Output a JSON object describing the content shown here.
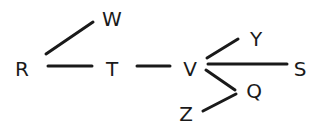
{
  "diagram": {
    "type": "tree",
    "nodes": [
      {
        "id": "R",
        "label": "R",
        "x": 22,
        "y": 76
      },
      {
        "id": "W",
        "label": "W",
        "x": 112,
        "y": 26
      },
      {
        "id": "T",
        "label": "T",
        "x": 112,
        "y": 76
      },
      {
        "id": "V",
        "label": "V",
        "x": 190,
        "y": 76
      },
      {
        "id": "Y",
        "label": "Y",
        "x": 256,
        "y": 46
      },
      {
        "id": "S",
        "label": "S",
        "x": 300,
        "y": 76
      },
      {
        "id": "Q",
        "label": "Q",
        "x": 254,
        "y": 98
      },
      {
        "id": "Z",
        "label": "Z",
        "x": 186,
        "y": 121
      }
    ],
    "edges": [
      {
        "from": "R",
        "to": "W",
        "x1": 46,
        "y1": 54,
        "x2": 93,
        "y2": 22
      },
      {
        "from": "R",
        "to": "T",
        "x1": 48,
        "y1": 66,
        "x2": 92,
        "y2": 66
      },
      {
        "from": "T",
        "to": "V",
        "x1": 137,
        "y1": 66,
        "x2": 170,
        "y2": 66
      },
      {
        "from": "V",
        "to": "Y",
        "x1": 207,
        "y1": 58,
        "x2": 238,
        "y2": 39
      },
      {
        "from": "V",
        "to": "S",
        "x1": 208,
        "y1": 64,
        "x2": 287,
        "y2": 64
      },
      {
        "from": "V",
        "to": "Q",
        "x1": 206,
        "y1": 70,
        "x2": 235,
        "y2": 90
      },
      {
        "from": "Q",
        "to": "Z",
        "x1": 236,
        "y1": 94,
        "x2": 203,
        "y2": 111
      }
    ]
  }
}
